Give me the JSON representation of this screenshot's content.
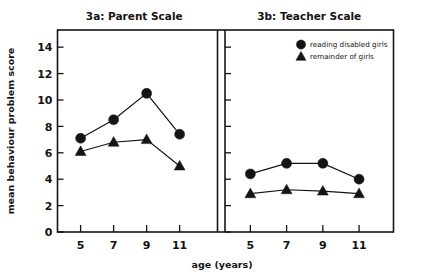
{
  "figure": {
    "xlabel": "age (years)",
    "ylabel": "mean behaviour problem score"
  },
  "legend": {
    "entries": [
      {
        "marker": "circle-marker",
        "label": "reading disabled girls"
      },
      {
        "marker": "triangle-marker",
        "label": "remainder of girls"
      }
    ]
  },
  "chart_data": [
    {
      "type": "line",
      "title": "3a: Parent Scale",
      "xlabel": "age (years)",
      "ylabel": "mean behaviour problem score",
      "x": [
        5,
        7,
        9,
        11
      ],
      "xticklabels": [
        "5",
        "7",
        "9",
        "11"
      ],
      "yticks": [
        0,
        2,
        4,
        6,
        8,
        10,
        12,
        14
      ],
      "yticklabels": [
        "0",
        "2",
        "4",
        "6",
        "8",
        "10",
        "12",
        "14"
      ],
      "ylim": [
        0,
        15.3
      ],
      "xlim": [
        3.6,
        12.9
      ],
      "grid": false,
      "legend_position": "none",
      "series": [
        {
          "name": "reading disabled girls",
          "marker": "circle",
          "values": [
            7.1,
            8.5,
            10.5,
            7.4
          ]
        },
        {
          "name": "remainder of girls",
          "marker": "triangle",
          "values": [
            6.1,
            6.8,
            7.0,
            5.0
          ]
        }
      ]
    },
    {
      "type": "line",
      "title": "3b: Teacher Scale",
      "xlabel": "age (years)",
      "ylabel": "",
      "x": [
        5,
        7,
        9,
        11
      ],
      "xticklabels": [
        "5",
        "7",
        "9",
        "11"
      ],
      "yticks": [
        0,
        2,
        4,
        6,
        8,
        10,
        12,
        14
      ],
      "yticklabels": [
        "",
        "",
        "",
        "",
        "",
        "",
        "",
        ""
      ],
      "ylim": [
        0,
        15.3
      ],
      "xlim": [
        3.6,
        12.9
      ],
      "grid": false,
      "legend_position": "upper right",
      "series": [
        {
          "name": "reading disabled girls",
          "marker": "circle",
          "values": [
            4.4,
            5.2,
            5.2,
            4.0
          ]
        },
        {
          "name": "remainder of girls",
          "marker": "triangle",
          "values": [
            2.9,
            3.2,
            3.1,
            2.9
          ]
        }
      ]
    }
  ]
}
